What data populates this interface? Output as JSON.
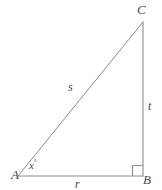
{
  "figure": {
    "type": "right-triangle-diagram",
    "background_color": "#ffffff",
    "stroke_color": "#8c8c8c",
    "label_color": "#4a4a4a",
    "vertices": [
      {
        "id": "A",
        "label": "A",
        "x": 18,
        "y": 176,
        "role": "bottom-left-angle-vertex"
      },
      {
        "id": "B",
        "label": "B",
        "x": 143,
        "y": 176,
        "role": "bottom-right-right-angle-vertex"
      },
      {
        "id": "C",
        "label": "C",
        "x": 143,
        "y": 22,
        "role": "top-apex-vertex"
      }
    ],
    "sides": [
      {
        "id": "r",
        "label": "r",
        "from": "A",
        "to": "B",
        "role": "base-adjacent"
      },
      {
        "id": "t",
        "label": "t",
        "from": "B",
        "to": "C",
        "role": "vertical-opposite"
      },
      {
        "id": "s",
        "label": "s",
        "from": "A",
        "to": "C",
        "role": "hypotenuse"
      }
    ],
    "angles": [
      {
        "id": "x",
        "label": "x",
        "degree_symbol": "°",
        "at_vertex": "A",
        "role": "unknown-angle"
      },
      {
        "id": "right-angle",
        "label": "",
        "at_vertex": "B",
        "role": "right-angle-marker",
        "marker": "square"
      }
    ]
  }
}
